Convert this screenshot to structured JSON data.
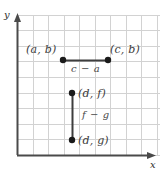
{
  "figure": {
    "kind": "coordinate-grid-diagram",
    "width": 163,
    "height": 178,
    "background": "#ffffff"
  },
  "axes": {
    "x_label": "x",
    "y_label": "y",
    "axis_color": "#4a4a4a",
    "origin": {
      "x": 17,
      "y": 155
    },
    "x_axis": {
      "x1": 17,
      "y1": 155,
      "x2": 155,
      "y2": 155
    },
    "y_axis": {
      "x1": 17,
      "y1": 155,
      "x2": 17,
      "y2": 16
    }
  },
  "grid": {
    "color": "#d2d2d2",
    "left": 17,
    "top": 15,
    "right": 160,
    "bottom": 155,
    "cell_size": 15.6,
    "columns": 9,
    "rows": 9,
    "x_lines": [
      17,
      32.6,
      48.2,
      63.8,
      79.4,
      95,
      110.6,
      126.2,
      141.8,
      157.4
    ],
    "y_lines": [
      15.2,
      30.8,
      46.4,
      62,
      77.6,
      93.2,
      108.8,
      124.4,
      140,
      155
    ]
  },
  "segments": [
    {
      "name": "horizontal-segment",
      "x1": 63,
      "y1": 60,
      "x2": 108,
      "y2": 60,
      "color": "#3d3d3d",
      "length_label": "c − a"
    },
    {
      "name": "vertical-segment",
      "x1": 72,
      "y1": 93,
      "x2": 72,
      "y2": 140,
      "color": "#3d3d3d",
      "length_label": "f − g"
    }
  ],
  "points": [
    {
      "name": "point-a-b",
      "label": "(a, b)",
      "x": 63,
      "y": 60,
      "color": "#1a1a1a"
    },
    {
      "name": "point-c-b",
      "label": "(c, b)",
      "x": 108,
      "y": 60,
      "color": "#1a1a1a"
    },
    {
      "name": "point-d-f",
      "label": "(d, f)",
      "x": 72,
      "y": 93,
      "color": "#1a1a1a"
    },
    {
      "name": "point-d-g",
      "label": "(d, g)",
      "x": 72,
      "y": 140,
      "color": "#1a1a1a"
    }
  ],
  "labels": {
    "a_b": "(a, b)",
    "c_b": "(c, b)",
    "d_f": "(d, f)",
    "d_g": "(d, g)",
    "c_minus_a": "c − a",
    "f_minus_g": "f − g"
  }
}
